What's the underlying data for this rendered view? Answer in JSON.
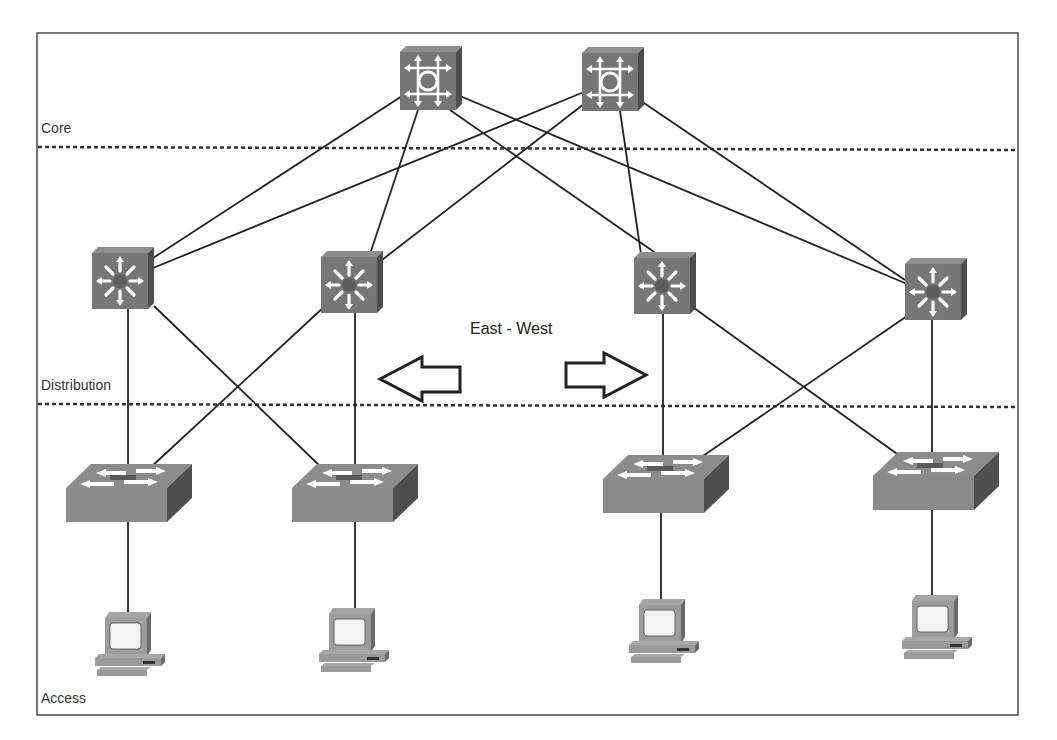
{
  "diagram": {
    "title": "",
    "layers": {
      "core": "Core",
      "distribution": "Distribution",
      "access": "Access"
    },
    "traffic_label": "East - West",
    "colors": {
      "device_face": "#7a7a7a",
      "device_side": "#555555",
      "device_top": "#8e8e8e",
      "switch_face": "#8a8a8a",
      "pc_body": "#9a9a9a",
      "line": "#222222"
    },
    "nodes": {
      "core": [
        {
          "id": "core-router-1",
          "type": "layer3-core-router",
          "x": 400,
          "y": 46
        },
        {
          "id": "core-router-2",
          "type": "layer3-core-router",
          "x": 582,
          "y": 47
        }
      ],
      "distribution": [
        {
          "id": "dist-switch-1",
          "type": "multilayer-switch",
          "x": 92,
          "y": 247
        },
        {
          "id": "dist-switch-2",
          "type": "multilayer-switch",
          "x": 321,
          "y": 251
        },
        {
          "id": "dist-switch-3",
          "type": "multilayer-switch",
          "x": 634,
          "y": 251
        },
        {
          "id": "dist-switch-4",
          "type": "multilayer-switch",
          "x": 905,
          "y": 257
        }
      ],
      "access_switches": [
        {
          "id": "access-switch-1",
          "type": "workgroup-switch",
          "x": 66,
          "y": 461
        },
        {
          "id": "access-switch-2",
          "type": "workgroup-switch",
          "x": 292,
          "y": 461
        },
        {
          "id": "access-switch-3",
          "type": "workgroup-switch",
          "x": 603,
          "y": 452
        },
        {
          "id": "access-switch-4",
          "type": "workgroup-switch",
          "x": 873,
          "y": 448
        }
      ],
      "hosts": [
        {
          "id": "pc-1",
          "type": "workstation",
          "x": 95,
          "y": 611
        },
        {
          "id": "pc-2",
          "type": "workstation",
          "x": 318,
          "y": 607
        },
        {
          "id": "pc-3",
          "type": "workstation",
          "x": 628,
          "y": 598
        },
        {
          "id": "pc-4",
          "type": "workstation",
          "x": 901,
          "y": 594
        }
      ]
    },
    "links": [
      {
        "from": "core-router-1",
        "to": "dist-switch-1"
      },
      {
        "from": "core-router-1",
        "to": "dist-switch-2"
      },
      {
        "from": "core-router-1",
        "to": "dist-switch-3"
      },
      {
        "from": "core-router-1",
        "to": "dist-switch-4"
      },
      {
        "from": "core-router-2",
        "to": "dist-switch-1"
      },
      {
        "from": "core-router-2",
        "to": "dist-switch-2"
      },
      {
        "from": "core-router-2",
        "to": "dist-switch-3"
      },
      {
        "from": "core-router-2",
        "to": "dist-switch-4"
      },
      {
        "from": "dist-switch-1",
        "to": "access-switch-1"
      },
      {
        "from": "dist-switch-1",
        "to": "access-switch-2"
      },
      {
        "from": "dist-switch-2",
        "to": "access-switch-1"
      },
      {
        "from": "dist-switch-2",
        "to": "access-switch-2"
      },
      {
        "from": "dist-switch-3",
        "to": "access-switch-3"
      },
      {
        "from": "dist-switch-3",
        "to": "access-switch-4"
      },
      {
        "from": "dist-switch-4",
        "to": "access-switch-3"
      },
      {
        "from": "dist-switch-4",
        "to": "access-switch-4"
      },
      {
        "from": "access-switch-1",
        "to": "pc-1"
      },
      {
        "from": "access-switch-2",
        "to": "pc-2"
      },
      {
        "from": "access-switch-3",
        "to": "pc-3"
      },
      {
        "from": "access-switch-4",
        "to": "pc-4"
      }
    ],
    "arrows": [
      {
        "direction": "left",
        "label": "west-arrow"
      },
      {
        "direction": "right",
        "label": "east-arrow"
      }
    ]
  }
}
